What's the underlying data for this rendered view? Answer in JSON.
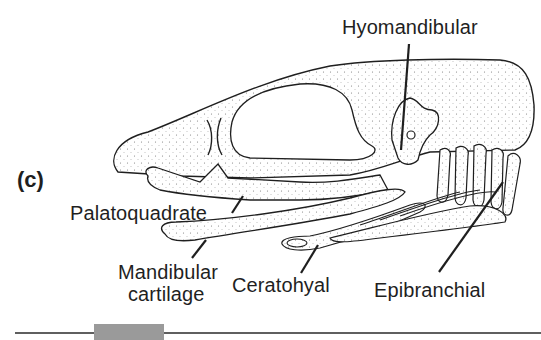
{
  "figure": {
    "panel_letter": "(c)",
    "labels": {
      "hyomandibular": "Hyomandibular",
      "palatoquadrate": "Palatoquadrate",
      "mandibular_line1": "Mandibular",
      "mandibular_line2": "cartilage",
      "ceratohyal": "Ceratohyal",
      "epibranchial": "Epibranchial"
    },
    "colors": {
      "ink": "#1f1f1f",
      "stipple": "#7a7a7a",
      "bar_fill": "#9a9a9a",
      "rule": "#2a2a2a"
    }
  }
}
